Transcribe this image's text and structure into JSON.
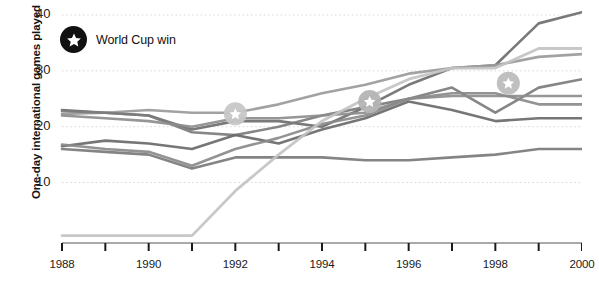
{
  "chart_data": {
    "type": "line",
    "title": "",
    "xlabel": "",
    "ylabel": "One-day international games played",
    "xlim": [
      1988,
      2000
    ],
    "ylim": [
      0,
      42
    ],
    "yticks": [
      10,
      20,
      30,
      40
    ],
    "ytick_labels": [
      "10",
      "20",
      "30",
      "40"
    ],
    "xticks": [
      1988,
      1989,
      1990,
      1991,
      1992,
      1993,
      1994,
      1995,
      1996,
      1997,
      1998,
      1999,
      2000
    ],
    "xtick_labels": [
      "1988",
      "",
      "1990",
      "",
      "1992",
      "",
      "1994",
      "",
      "1996",
      "",
      "1998",
      "",
      "2000"
    ],
    "grid": "horizontal-dotted",
    "legend": {
      "position": "top-left",
      "entries": [
        {
          "label": "World Cup win",
          "marker": "star-in-circle",
          "color": "#111111"
        }
      ]
    },
    "x": [
      1988,
      1989,
      1990,
      1991,
      1992,
      1993,
      1994,
      1995,
      1996,
      1997,
      1998,
      1999,
      2000
    ],
    "series": [
      {
        "name": "series-1",
        "color": "#6e6e6e",
        "width": 2.6,
        "values": [
          23.0,
          22.5,
          22.0,
          19.5,
          21.0,
          21.0,
          20.0,
          23.5,
          27.5,
          30.5,
          31.0,
          38.5,
          40.5
        ]
      },
      {
        "name": "series-2",
        "color": "#9a9a9a",
        "width": 2.6,
        "values": [
          22.3,
          22.5,
          23.0,
          22.5,
          22.5,
          24.0,
          26.0,
          27.5,
          29.5,
          30.5,
          31.0,
          32.5,
          33.0
        ]
      },
      {
        "name": "series-3",
        "color": "#7c7c7c",
        "width": 2.6,
        "values": [
          22.8,
          22.5,
          22.0,
          19.0,
          18.5,
          20.0,
          22.0,
          23.5,
          25.0,
          27.0,
          22.5,
          27.0,
          28.5
        ]
      },
      {
        "name": "series-4",
        "color": "#8d8d8d",
        "width": 2.6,
        "values": [
          22.0,
          21.5,
          21.0,
          20.0,
          21.5,
          21.5,
          22.0,
          22.5,
          25.0,
          25.5,
          25.5,
          25.5,
          25.5
        ]
      },
      {
        "name": "series-5",
        "color": "#6a6a6a",
        "width": 2.6,
        "values": [
          16.5,
          17.5,
          17.0,
          16.0,
          18.5,
          17.0,
          19.5,
          21.5,
          24.5,
          23.0,
          21.0,
          21.5,
          21.5
        ]
      },
      {
        "name": "series-6",
        "color": "#8a8a8a",
        "width": 2.6,
        "values": [
          16.8,
          16.0,
          15.5,
          13.0,
          16.0,
          18.0,
          20.5,
          22.0,
          25.0,
          26.0,
          26.0,
          24.0,
          24.0
        ]
      },
      {
        "name": "series-7",
        "color": "#7a7a7a",
        "width": 2.6,
        "values": [
          16.0,
          15.5,
          15.0,
          12.5,
          14.5,
          14.5,
          14.5,
          14.0,
          14.0,
          14.5,
          15.0,
          16.0,
          16.0
        ]
      },
      {
        "name": "series-8",
        "color": "#c3c3c3",
        "width": 2.8,
        "values": [
          0.5,
          0.5,
          0.5,
          0.5,
          8.5,
          15.0,
          21.0,
          25.0,
          28.5,
          30.5,
          30.5,
          34.0,
          34.0
        ]
      }
    ],
    "markers": [
      {
        "label": "World Cup win",
        "x": 1992,
        "y": 22.3,
        "shape": "star-in-circle",
        "color": "#c7c7c7"
      },
      {
        "label": "World Cup win",
        "x": 1995.1,
        "y": 24.5,
        "shape": "star-in-circle",
        "color": "#b4b4b4"
      },
      {
        "label": "World Cup win",
        "x": 1998.3,
        "y": 27.8,
        "shape": "star-in-circle",
        "color": "#bdbdbd"
      }
    ]
  }
}
